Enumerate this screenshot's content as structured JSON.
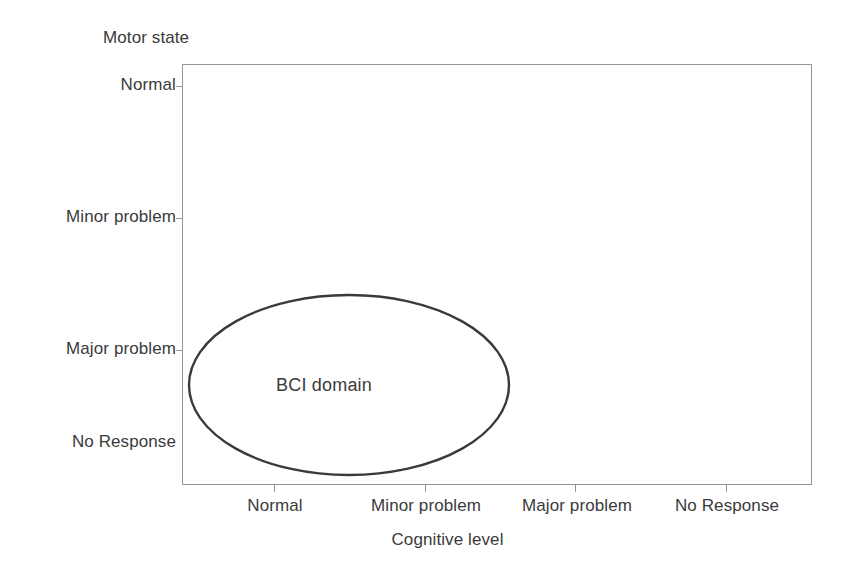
{
  "chart_data": {
    "type": "scatter",
    "title": "",
    "subtitle": "",
    "xlabel": "Cognitive level",
    "ylabel": "Motor state",
    "grid": false,
    "legend": null,
    "x_categories": [
      "Normal",
      "Minor problem",
      "Major problem",
      "No Response"
    ],
    "y_categories": [
      "Normal",
      "Minor problem",
      "Major problem",
      "No Response"
    ],
    "xlim": [
      "Normal",
      "No Response"
    ],
    "ylim": [
      "Normal",
      "No Response"
    ],
    "series": [],
    "annotations": [
      {
        "label": "BCI domain",
        "shape": "ellipse",
        "x_range": [
          "Normal",
          "Minor problem"
        ],
        "y_range": [
          "Major problem",
          "No Response"
        ],
        "center_x_category": "Normal-to-Minor problem",
        "center_y_category": "between Major problem and No Response",
        "stroke_color": "#3a3a3a",
        "fill": "none"
      }
    ]
  },
  "axes": {
    "y": {
      "title": "Motor state",
      "ticks": [
        {
          "label": "Normal",
          "y": 86,
          "tick_mark": true
        },
        {
          "label": "Minor problem",
          "y": 218,
          "tick_mark": true
        },
        {
          "label": "Major problem",
          "y": 350,
          "tick_mark": true
        },
        {
          "label": "No Response",
          "y": 443,
          "tick_mark": false
        }
      ]
    },
    "x": {
      "title": "Cognitive level",
      "ticks": [
        {
          "label": "Normal",
          "x": 274,
          "tick_mark": true
        },
        {
          "label": "Minor problem",
          "x": 425,
          "tick_mark": true
        },
        {
          "label": "Major problem",
          "x": 575,
          "tick_mark": true
        },
        {
          "label": "No Response",
          "x": 726,
          "tick_mark": true
        }
      ]
    }
  },
  "region": {
    "label": "BCI domain",
    "label_x": 324,
    "label_y": 385,
    "cx": 349,
    "cy": 385,
    "rx": 160,
    "ry": 90,
    "stroke": "#3a3a3a",
    "stroke_width": 2.4
  },
  "colors": {
    "background": "#ffffff",
    "frame": "#949494",
    "text": "#3b3b3b",
    "region_stroke": "#3a3a3a"
  }
}
